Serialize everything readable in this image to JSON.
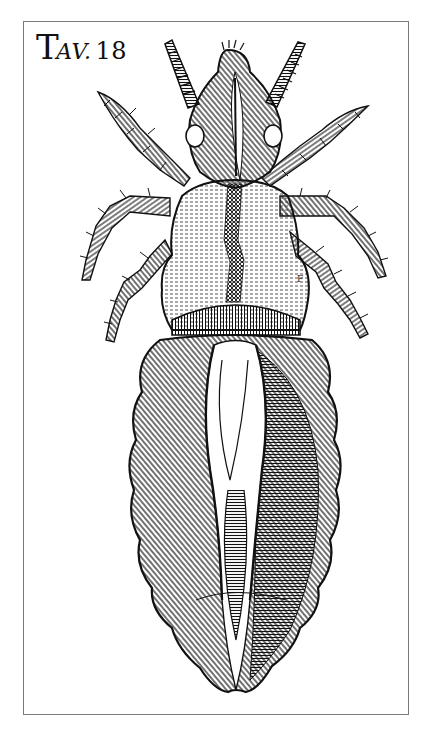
{
  "plate": {
    "title_initial": "T",
    "title_small": "AV.",
    "title_number": "18",
    "letter_mark": "F",
    "subject": "louse-engraving",
    "colors": {
      "ink": "#111111",
      "paper": "#ffffff",
      "frame": "#7a7a7a"
    }
  }
}
